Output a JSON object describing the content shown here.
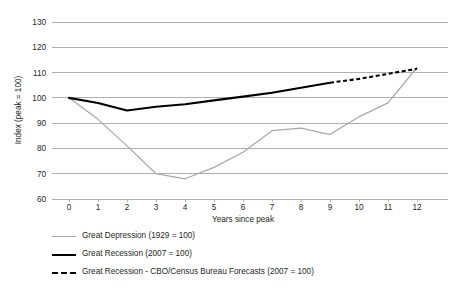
{
  "chart_data": {
    "type": "line",
    "title": "",
    "xlabel": "Years since peak",
    "ylabel": "Index (peak = 100)",
    "x": [
      0,
      1,
      2,
      3,
      4,
      5,
      6,
      7,
      8,
      9,
      10,
      11,
      12
    ],
    "xlim": [
      0,
      12
    ],
    "ylim": [
      60,
      130
    ],
    "xticks": [
      "0",
      "1",
      "2",
      "3",
      "4",
      "5",
      "6",
      "7",
      "8",
      "9",
      "10",
      "11",
      "12"
    ],
    "yticks": [
      "60",
      "70",
      "80",
      "90",
      "100",
      "110",
      "120",
      "130"
    ],
    "grid": "horizontal",
    "legend_position": "below",
    "series": [
      {
        "name": "Great Depression (1929 = 100)",
        "style": "solid-thin",
        "color": "#a8a8a8",
        "x": [
          0,
          1,
          2,
          3,
          4,
          5,
          6,
          7,
          8,
          9,
          10,
          11,
          12
        ],
        "values": [
          100,
          91.5,
          81,
          70,
          68,
          72.5,
          78.5,
          87,
          88,
          85.5,
          92.5,
          98,
          112
        ]
      },
      {
        "name": "Great Recession (2007 = 100)",
        "style": "solid-thick",
        "color": "#000000",
        "x": [
          0,
          1,
          2,
          3,
          4,
          5,
          6,
          7,
          8,
          9
        ],
        "values": [
          100,
          98,
          95,
          96.5,
          97.5,
          99,
          100.5,
          102,
          104,
          106
        ]
      },
      {
        "name": "Great Recession - CBO/Census Bureau Forecasts (2007 = 100)",
        "style": "dashed-thick",
        "color": "#000000",
        "x": [
          9,
          10,
          11,
          12
        ],
        "values": [
          106,
          107.5,
          109.5,
          111.5
        ]
      }
    ]
  },
  "axes": {
    "y_title": "Index (peak = 100)",
    "x_title": "Years since peak",
    "y_tick_labels": [
      "130",
      "120",
      "110",
      "100",
      "90",
      "80",
      "70",
      "60"
    ],
    "x_tick_labels": [
      "0",
      "1",
      "2",
      "3",
      "4",
      "5",
      "6",
      "7",
      "8",
      "9",
      "10",
      "11",
      "12"
    ]
  },
  "legend": {
    "items": [
      {
        "label": "Great Depression (1929 = 100)",
        "swatch": "thin-gray-line"
      },
      {
        "label": "Great Recession (2007 = 100)",
        "swatch": "thick-black-line"
      },
      {
        "label": "Great Recession - CBO/Census Bureau Forecasts (2007 = 100)",
        "swatch": "thick-black-dashed-line"
      }
    ]
  }
}
